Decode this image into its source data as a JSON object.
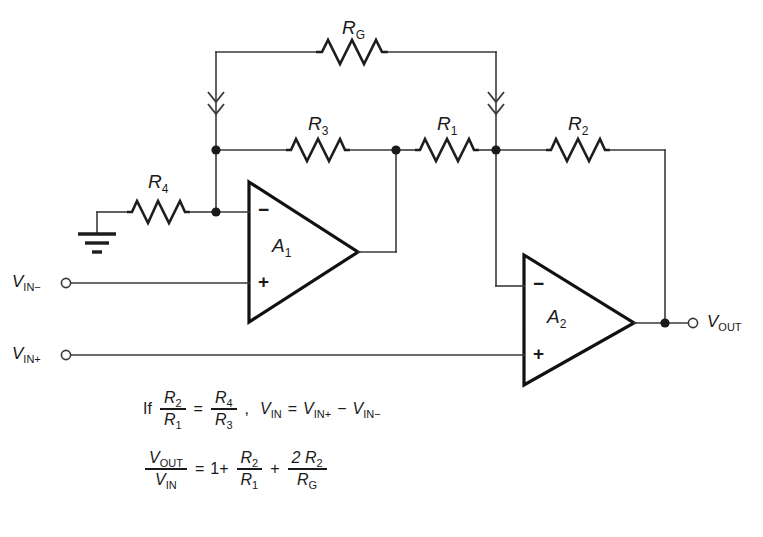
{
  "diagram": {
    "ink_color": "#1a1a1a",
    "wire_color": "#3a3a3a",
    "background": "#ffffff"
  },
  "resistors": [
    {
      "id": "RG",
      "label_main": "R",
      "label_sub": "G",
      "x": 352,
      "y": 28
    },
    {
      "id": "R3",
      "label_main": "R",
      "label_sub": "3",
      "x": 318,
      "y": 124
    },
    {
      "id": "R1",
      "label_main": "R",
      "label_sub": "1",
      "x": 447,
      "y": 124
    },
    {
      "id": "R2",
      "label_main": "R",
      "label_sub": "2",
      "x": 578,
      "y": 124
    },
    {
      "id": "R4",
      "label_main": "R",
      "label_sub": "4",
      "x": 158,
      "y": 182
    }
  ],
  "amplifiers": [
    {
      "id": "A1",
      "label_main": "A",
      "label_sub": "1",
      "minus": "−",
      "plus": "+",
      "label_x": 278,
      "label_y": 243
    },
    {
      "id": "A2",
      "label_main": "A",
      "label_sub": "2",
      "minus": "−",
      "plus": "+",
      "label_x": 553,
      "label_y": 314
    }
  ],
  "ports": [
    {
      "id": "vin-minus",
      "main": "V",
      "sub": "IN−",
      "x": 10,
      "y": 274,
      "terminal_x": 66,
      "terminal_y": 283
    },
    {
      "id": "vin-plus",
      "main": "V",
      "sub": "IN+",
      "x": 10,
      "y": 346,
      "terminal_x": 66,
      "terminal_y": 355
    },
    {
      "id": "vout",
      "main": "V",
      "sub": "OUT",
      "x": 707,
      "y": 314,
      "terminal_x": 693,
      "terminal_y": 323
    }
  ],
  "ground": {
    "id": "ground-symbol",
    "x": 97,
    "y": 233
  },
  "equations": [
    {
      "id": "equation-condition",
      "if_word": "If",
      "parts": [
        {
          "kind": "frac",
          "num_main": "R",
          "num_sub": "2",
          "den_main": "R",
          "den_sub": "1"
        },
        {
          "kind": "op",
          "text": "="
        },
        {
          "kind": "frac",
          "num_main": "R",
          "num_sub": "4",
          "den_main": "R",
          "den_sub": "3"
        },
        {
          "kind": "op",
          "text": ","
        },
        {
          "kind": "var",
          "main": "V",
          "sub": "IN"
        },
        {
          "kind": "op",
          "text": "="
        },
        {
          "kind": "var",
          "main": "V",
          "sub": "IN+"
        },
        {
          "kind": "op",
          "text": "−"
        },
        {
          "kind": "var",
          "main": "V",
          "sub": "IN−"
        }
      ]
    },
    {
      "id": "equation-gain",
      "if_word": "",
      "parts": [
        {
          "kind": "frac",
          "num_main": "V",
          "num_sub": "OUT",
          "den_main": "V",
          "den_sub": "IN"
        },
        {
          "kind": "op",
          "text": "="
        },
        {
          "kind": "op",
          "text": "1+"
        },
        {
          "kind": "frac",
          "num_main": "R",
          "num_sub": "2",
          "den_main": "R",
          "den_sub": "1"
        },
        {
          "kind": "op",
          "text": "+"
        },
        {
          "kind": "frac",
          "num_main": "2 R",
          "num_sub": "2",
          "den_main": "R",
          "den_sub": "G"
        }
      ]
    }
  ]
}
